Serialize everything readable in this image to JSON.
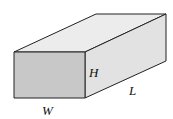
{
  "diagram": {
    "type": "rectangular-box",
    "labels": {
      "height": "H",
      "width": "W",
      "length": "L"
    },
    "colors": {
      "front": "#c8c8c8",
      "top": "#ececec",
      "side": "#e2e2e2",
      "edge": "#222222"
    }
  }
}
